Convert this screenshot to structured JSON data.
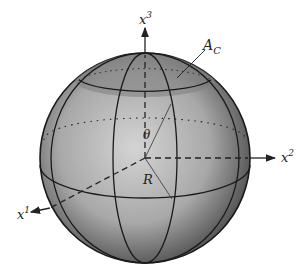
{
  "diagram": {
    "type": "sphere-spherical-cap",
    "labels": {
      "x1": "x",
      "x1_sup": "1",
      "x2": "x",
      "x2_sup": "2",
      "x3": "x",
      "x3_sup": "3",
      "cap_area": "A",
      "cap_area_sub": "C",
      "angle": "θ",
      "radius": "R"
    },
    "colors": {
      "sphere_light": "#c8c8c8",
      "sphere_mid": "#9a9a9a",
      "sphere_dark": "#555555",
      "cap_fill": "#8a8a8a",
      "line": "#1a1a1a"
    }
  }
}
